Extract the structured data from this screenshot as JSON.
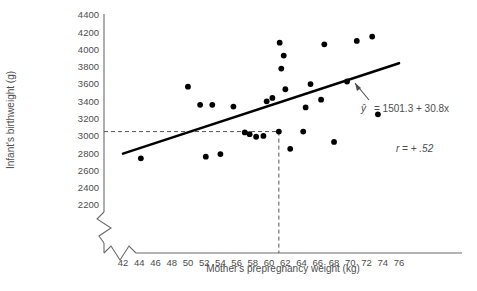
{
  "chart_data": {
    "type": "scatter",
    "title": "",
    "xlabel": "Mother's prepregnancy weight (kg)",
    "ylabel": "Infant's birthweight (g)",
    "xlim": [
      41,
      77
    ],
    "ylim": [
      2100,
      4500
    ],
    "xticks": [
      42,
      44,
      46,
      48,
      50,
      52,
      54,
      56,
      58,
      60,
      62,
      64,
      66,
      68,
      70,
      72,
      74,
      76
    ],
    "yticks": [
      2200,
      2400,
      2600,
      2800,
      3000,
      3200,
      3400,
      3600,
      3800,
      4000,
      4200,
      4400
    ],
    "grid": false,
    "legend": null,
    "axis_break_x": true,
    "axis_break_y": true,
    "points": [
      {
        "x": 44.2,
        "y": 2740
      },
      {
        "x": 50.0,
        "y": 3570
      },
      {
        "x": 51.5,
        "y": 3360
      },
      {
        "x": 52.2,
        "y": 2760
      },
      {
        "x": 53.0,
        "y": 3360
      },
      {
        "x": 54.0,
        "y": 2790
      },
      {
        "x": 55.6,
        "y": 3340
      },
      {
        "x": 57.0,
        "y": 3040
      },
      {
        "x": 57.6,
        "y": 3020
      },
      {
        "x": 58.4,
        "y": 2990
      },
      {
        "x": 59.3,
        "y": 3000
      },
      {
        "x": 59.7,
        "y": 3400
      },
      {
        "x": 60.4,
        "y": 3440
      },
      {
        "x": 61.2,
        "y": 3050
      },
      {
        "x": 61.3,
        "y": 4080
      },
      {
        "x": 61.5,
        "y": 3780
      },
      {
        "x": 61.8,
        "y": 3930
      },
      {
        "x": 62.0,
        "y": 3540
      },
      {
        "x": 62.6,
        "y": 2850
      },
      {
        "x": 64.2,
        "y": 3050
      },
      {
        "x": 64.5,
        "y": 3330
      },
      {
        "x": 65.1,
        "y": 3600
      },
      {
        "x": 66.4,
        "y": 3420
      },
      {
        "x": 66.8,
        "y": 4060
      },
      {
        "x": 68.0,
        "y": 2930
      },
      {
        "x": 69.6,
        "y": 3630
      },
      {
        "x": 70.8,
        "y": 4100
      },
      {
        "x": 72.7,
        "y": 4150
      },
      {
        "x": 73.4,
        "y": 3250
      }
    ],
    "regression_line": {
      "equation_label": "= 1501.3 + 30.8x",
      "y_hat_symbol": "ŷ",
      "intercept": 1501.3,
      "slope": 30.8,
      "x_start": 42.0,
      "x_end": 76.0
    },
    "correlation": {
      "label": "r = + .52",
      "value": 0.52
    },
    "reference_lines": {
      "description": "Dashed projection lines from x = 61.2 up to point and across to y-axis at about 3050 g",
      "x_value": 61.2,
      "y_value": 3050,
      "style": "dashed"
    }
  },
  "axis_labels": {
    "x_title": "Mother's prepregnancy weight (kg)",
    "y_title": "Infant's birthweight (g)"
  },
  "annotations": {
    "equation_prefix": "ŷ",
    "equation_body": "= 1501.3 + 30.8x",
    "correlation_text": "r = + .52"
  },
  "colors": {
    "point": "#000000",
    "line": "#000000",
    "axis": "#6b6b6b",
    "text": "#4d4d4d",
    "dashed": "#555555",
    "background": "#ffffff"
  }
}
